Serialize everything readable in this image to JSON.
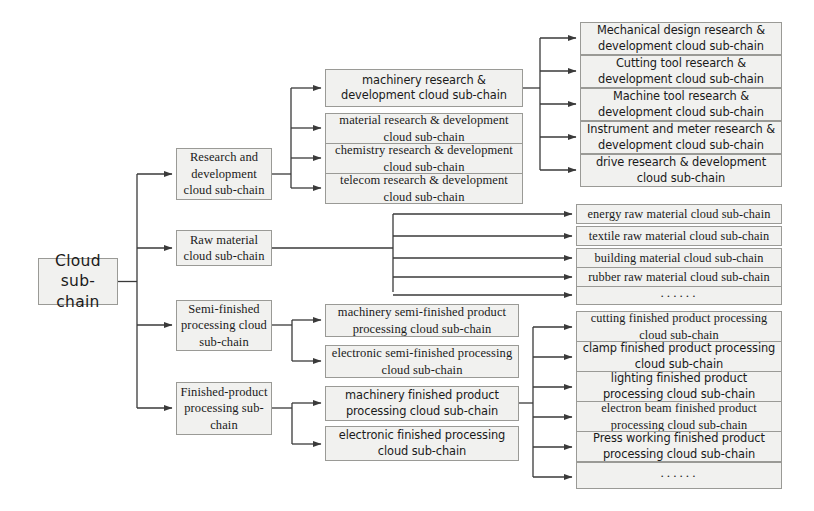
{
  "diagram": {
    "colors": {
      "box_fill": "#f1f1ef",
      "box_border": "#9a9a96",
      "connector": "#3a3a3a",
      "background": "#ffffff"
    },
    "root": {
      "label": "Cloud\nsub-chain"
    },
    "level2": [
      {
        "label": "Research and development cloud sub-chain"
      },
      {
        "label": "Raw material cloud sub-chain"
      },
      {
        "label": "Semi-finished processing cloud sub-chain"
      },
      {
        "label": "Finished-product processing sub-chain"
      }
    ],
    "rd_children": [
      {
        "label": "machinery research & development cloud sub-chain"
      },
      {
        "label": "material research & development cloud sub-chain"
      },
      {
        "label": "chemistry research & development cloud sub-chain"
      },
      {
        "label": "telecom research & development cloud sub-chain"
      }
    ],
    "machinery_rd_children": [
      {
        "label": "Mechanical design research & development cloud sub-chain"
      },
      {
        "label": "Cutting tool research & development cloud sub-chain"
      },
      {
        "label": "Machine tool research & development cloud sub-chain"
      },
      {
        "label": "Instrument and meter research & development cloud sub-chain"
      },
      {
        "label": "drive research & development cloud sub-chain"
      }
    ],
    "raw_material_children": [
      {
        "label": "energy raw material cloud sub-chain"
      },
      {
        "label": "textile raw material cloud sub-chain"
      },
      {
        "label": "building material cloud sub-chain"
      },
      {
        "label": "rubber raw material cloud sub-chain"
      },
      {
        "label": "······"
      }
    ],
    "semi_finished_children": [
      {
        "label": "machinery semi-finished product processing cloud sub-chain"
      },
      {
        "label": "electronic semi-finished processing cloud sub-chain"
      }
    ],
    "finished_children": [
      {
        "label": "machinery finished product processing cloud sub-chain"
      },
      {
        "label": "electronic finished processing cloud sub-chain"
      }
    ],
    "machinery_finished_children": [
      {
        "label": "cutting finished product processing cloud sub-chain"
      },
      {
        "label": "clamp finished product processing cloud sub-chain"
      },
      {
        "label": "lighting finished product processing cloud sub-chain"
      },
      {
        "label": "electron beam finished product processing cloud sub-chain"
      },
      {
        "label": "Press working finished product processing cloud sub-chain"
      },
      {
        "label": "······"
      }
    ]
  }
}
